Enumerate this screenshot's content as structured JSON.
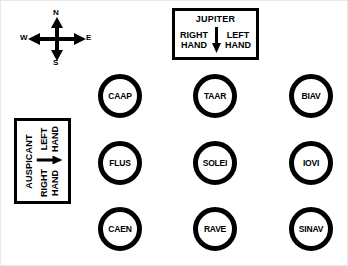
{
  "diagram": {
    "background_color": "#ffffff",
    "ink_color": "#000000"
  },
  "compass": {
    "name": "compass-rose",
    "north": "N",
    "south": "S",
    "west": "W",
    "east": "E"
  },
  "jupiter_box": {
    "title": "JUPITER",
    "left_label_line1": "RIGHT",
    "left_label_line2": "HAND",
    "right_label_line1": "LEFT",
    "right_label_line2": "HAND",
    "arrow_direction": "down"
  },
  "auspicant_box": {
    "title": "AUSPICANT",
    "left_label_line1": "RIGHT",
    "left_label_line2": "HAND",
    "right_label_line1": "LEFT",
    "right_label_line2": "HAND",
    "arrow_direction": "right",
    "rotation": "-90deg"
  },
  "nodes": [
    {
      "label": "CAAP",
      "row": 0,
      "col": 0
    },
    {
      "label": "TAAR",
      "row": 0,
      "col": 1
    },
    {
      "label": "BIAV",
      "row": 0,
      "col": 2
    },
    {
      "label": "FLUS",
      "row": 1,
      "col": 0
    },
    {
      "label": "SOLEI",
      "row": 1,
      "col": 1
    },
    {
      "label": "IOVI",
      "row": 1,
      "col": 2
    },
    {
      "label": "CAEN",
      "row": 2,
      "col": 0
    },
    {
      "label": "RAVE",
      "row": 2,
      "col": 1
    },
    {
      "label": "SINAV",
      "row": 2,
      "col": 2
    }
  ]
}
